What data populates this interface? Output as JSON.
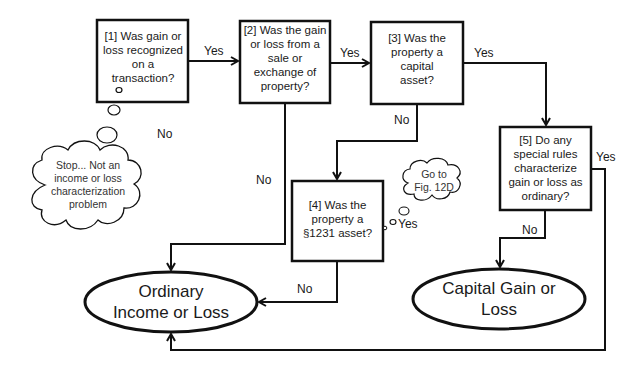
{
  "diagram": {
    "type": "flowchart",
    "nodes": {
      "q1": {
        "text": "[1] Was gain or loss recognized on a transaction?"
      },
      "q2": {
        "text": "[2] Was the gain or loss from a sale or exchange of property?"
      },
      "q3": {
        "text": "[3] Was the property a capital asset?"
      },
      "q4": {
        "text": "[4] Was the property  a §1231 asset?"
      },
      "q5": {
        "text": "[5] Do any special rules characterize gain or loss as ordinary?"
      },
      "ordinary": {
        "text": "Ordinary Income or Loss"
      },
      "capital": {
        "text": "Capital Gain or Loss"
      },
      "stop_cloud": {
        "text": "Stop... Not an income or loss characterization problem"
      },
      "goto_cloud": {
        "text": "Go to Fig. 12D"
      }
    },
    "edge_labels": {
      "q1_yes": "Yes",
      "q1_no": "No",
      "q2_yes": "Yes",
      "q2_no": "No",
      "q3_yes": "Yes",
      "q3_no": "No",
      "q4_yes": "Yes",
      "q4_no": "No",
      "q5_yes": "Yes",
      "q5_no": "No"
    },
    "colors": {
      "stroke": "#111111",
      "text": "#1a1a1a",
      "background": "#ffffff"
    }
  }
}
